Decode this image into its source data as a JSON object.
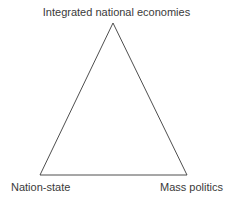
{
  "diagram": {
    "type": "triangle",
    "vertices": {
      "top": {
        "label": "Integrated national economies"
      },
      "bottom_left": {
        "label": "Nation-state"
      },
      "bottom_right": {
        "label": "Mass politics"
      }
    },
    "colors": {
      "line": "#3a3a3a",
      "text": "#3a3a3a",
      "background": "#ffffff"
    }
  }
}
